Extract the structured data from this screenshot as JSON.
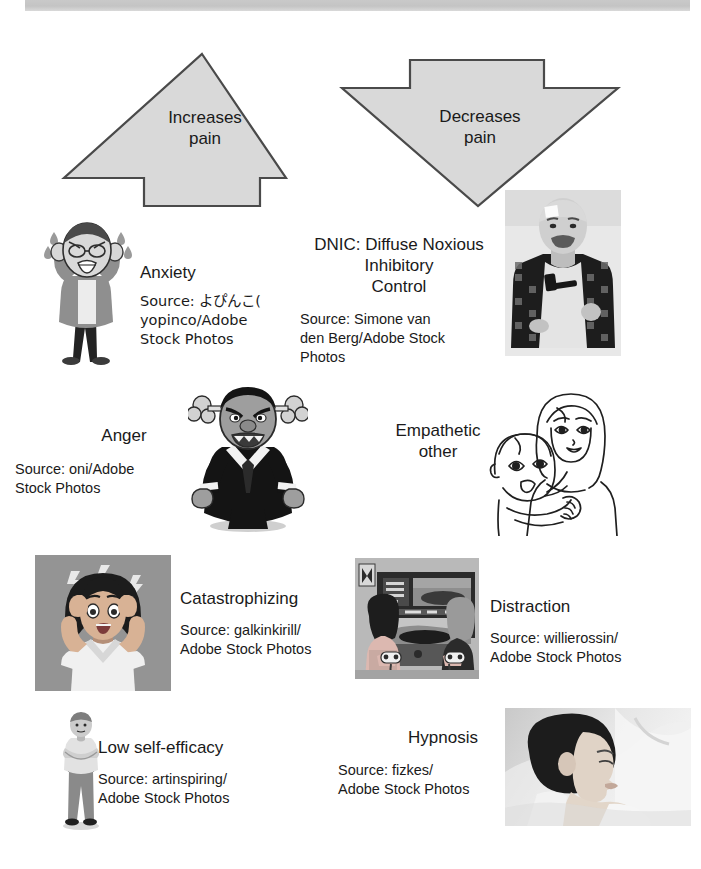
{
  "figure": {
    "title_band": "",
    "arrows": [
      {
        "id": "increases-pain",
        "direction": "up",
        "label": "Increases\npain",
        "fill": "#d9d9d9",
        "stroke": "#4a4a4a"
      },
      {
        "id": "decreases-pain",
        "direction": "down",
        "label": "Decreases\npain",
        "fill": "#d9d9d9",
        "stroke": "#4a4a4a"
      }
    ],
    "items": [
      {
        "id": "anxiety",
        "column": "left",
        "label": "Anxiety",
        "source": "Source: よぴんこ(\nyopinco/Adobe\nStock Photos",
        "art": "anxious-elderly-man-illustration"
      },
      {
        "id": "dnic",
        "column": "right",
        "label": "DNIC: Diffuse Noxious\nInhibitory\nControl",
        "source": "Source: Simone van\nden Berg/Adobe Stock\nPhotos",
        "art": "man-with-hammer-photo"
      },
      {
        "id": "anger",
        "column": "left",
        "label": "Anger",
        "source": "Source: oni/Adobe\nStock Photos",
        "art": "angry-oni-in-suit-illustration"
      },
      {
        "id": "empathetic-other",
        "column": "right",
        "label": "Empathetic\nother",
        "source": "",
        "art": "mother-holding-child-line-drawing"
      },
      {
        "id": "catastrophizing",
        "column": "left",
        "label": "Catastrophizing",
        "source": "Source: galkinkirill/\nAdobe Stock Photos",
        "art": "woman-clutching-head-illustration"
      },
      {
        "id": "distraction",
        "column": "right",
        "label": "Distraction",
        "source": "Source: willierossin/\nAdobe Stock Photos",
        "art": "children-playing-video-games-illustration"
      },
      {
        "id": "low-self-efficacy",
        "column": "left",
        "label": "Low self-efficacy",
        "source": "Source: artinspiring/\nAdobe Stock Photos",
        "art": "standing-person-illustration"
      },
      {
        "id": "hypnosis",
        "column": "right",
        "label": "Hypnosis",
        "source": "Source: fizkes/\nAdobe Stock Photos",
        "art": "relaxed-woman-photo"
      }
    ],
    "colors": {
      "arrow_fill": "#d9d9d9",
      "arrow_stroke": "#4a4a4a",
      "band": "#c7c7c7",
      "text": "#1a1a1a"
    }
  }
}
